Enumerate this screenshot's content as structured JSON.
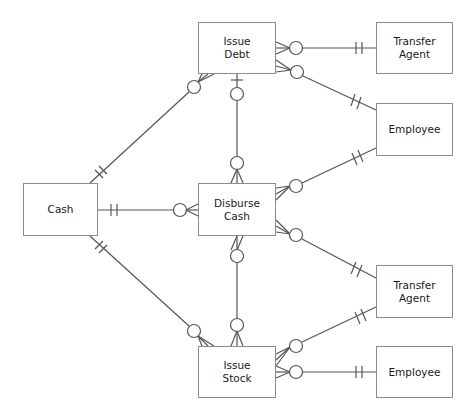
{
  "diagram": {
    "type": "entity-relationship (crow's foot notation)",
    "colors": {
      "line": "#555555",
      "box_border": "#8c8c8c",
      "text": "#1a1a1a",
      "background": "#ffffff"
    },
    "entities": {
      "cash": {
        "label": "Cash"
      },
      "issue_debt": {
        "label": "Issue\nDebt"
      },
      "disburse_cash": {
        "label": "Disburse\nCash"
      },
      "issue_stock": {
        "label": "Issue\nStock"
      },
      "transfer_agent_top": {
        "label": "Transfer\nAgent"
      },
      "employee_top": {
        "label": "Employee"
      },
      "transfer_agent_bottom": {
        "label": "Transfer\nAgent"
      },
      "employee_bottom": {
        "label": "Employee"
      }
    },
    "relationships": [
      {
        "from": "Cash",
        "to": "Issue Debt",
        "from_end": "one-and-only-one",
        "to_end": "zero-or-many"
      },
      {
        "from": "Cash",
        "to": "Disburse Cash",
        "from_end": "one-and-only-one",
        "to_end": "zero-or-many"
      },
      {
        "from": "Cash",
        "to": "Issue Stock",
        "from_end": "one-and-only-one",
        "to_end": "zero-or-many"
      },
      {
        "from": "Issue Debt",
        "to": "Disburse Cash",
        "from_end": "zero-or-one",
        "to_end": "zero-or-many"
      },
      {
        "from": "Issue Stock",
        "to": "Disburse Cash",
        "from_end": "zero-or-many",
        "to_end": "zero-or-many"
      },
      {
        "from": "Transfer Agent",
        "to": "Issue Debt",
        "from_end": "one-and-only-one",
        "to_end": "zero-or-many"
      },
      {
        "from": "Employee",
        "to": "Issue Debt",
        "from_end": "one-and-only-one",
        "to_end": "zero-or-many"
      },
      {
        "from": "Employee",
        "to": "Disburse Cash",
        "from_end": "one-and-only-one",
        "to_end": "zero-or-many"
      },
      {
        "from": "Transfer Agent",
        "to": "Disburse Cash",
        "from_end": "one-and-only-one",
        "to_end": "zero-or-many"
      },
      {
        "from": "Transfer Agent",
        "to": "Issue Stock",
        "from_end": "one-and-only-one",
        "to_end": "zero-or-many"
      },
      {
        "from": "Employee",
        "to": "Issue Stock",
        "from_end": "one-and-only-one",
        "to_end": "zero-or-many"
      }
    ]
  }
}
